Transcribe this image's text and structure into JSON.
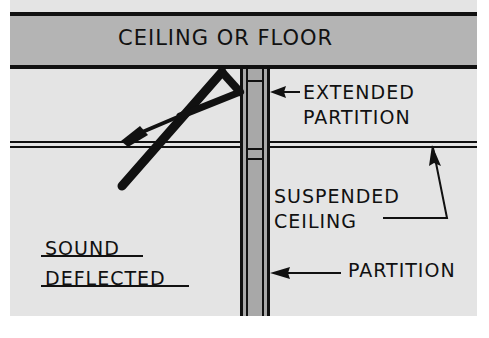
{
  "diagram": {
    "labels": {
      "slab": "CEILING OR FLOOR",
      "extended_partition_line1": "EXTENDED",
      "extended_partition_line2": "PARTITION",
      "suspended_ceiling_line1": "SUSPENDED",
      "suspended_ceiling_line2": "CEILING",
      "partition": "PARTITION",
      "sound_deflected_line1": "SOUND",
      "sound_deflected_line2": "DEFLECTED"
    },
    "colors": {
      "background": "#e4e4e4",
      "slab_fill": "#b4b4b4",
      "partition_fill": "#a8a8a8",
      "ink": "#111111"
    }
  }
}
